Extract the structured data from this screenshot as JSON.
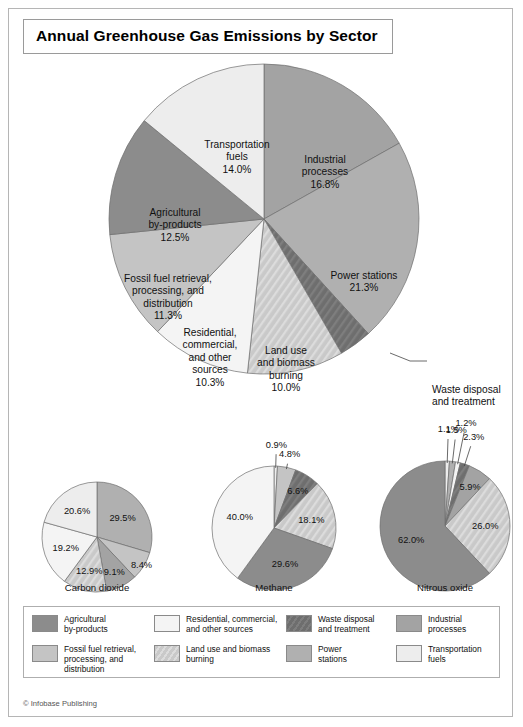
{
  "title": "Annual Greenhouse Gas Emissions by Sector",
  "credit": "© Infobase Publishing",
  "colors": {
    "agricultural": "#8c8c8c",
    "fossil_fuel": "#c4c4c4",
    "residential": "#f4f4f4",
    "land_use": "#c9c9c9",
    "waste": "#6e6e6e",
    "power": "#b0b0b0",
    "industrial": "#a3a3a3",
    "transportation": "#ededed",
    "outline": "#6e6e6e"
  },
  "chart_data": [
    {
      "type": "pie",
      "name": "main",
      "title": "Annual Greenhouse Gas Emissions by Sector",
      "start_angle": 0,
      "categories": [
        "Industrial processes",
        "Power stations",
        "Waste disposal and treatment",
        "Land use and biomass burning",
        "Residential, commercial, and other sources",
        "Fossil fuel retrieval, processing, and distribution",
        "Agricultural by-products",
        "Transportation fuels"
      ],
      "values": [
        16.8,
        21.3,
        3.4,
        10.0,
        10.3,
        11.3,
        12.5,
        14.0
      ],
      "keys": [
        "industrial",
        "power",
        "waste",
        "land_use",
        "residential",
        "fossil_fuel",
        "agricultural",
        "transportation"
      ],
      "labels": [
        {
          "lines": [
            "Industrial",
            "processes",
            "16.8%"
          ],
          "x": 316,
          "y": 108,
          "anchor": "middle",
          "callout": false
        },
        {
          "lines": [
            "Power stations",
            "21.3%"
          ],
          "x": 355,
          "y": 224,
          "anchor": "middle",
          "callout": false
        },
        {
          "lines": [
            "Waste disposal",
            "and treatment",
            "3.4%"
          ],
          "x": 423,
          "y": 338,
          "anchor": "start",
          "callout": true
        },
        {
          "lines": [
            "Land use",
            "and biomass",
            "burning",
            "10.0%"
          ],
          "x": 277,
          "y": 299,
          "anchor": "middle",
          "callout": false
        },
        {
          "lines": [
            "Residential,",
            "commercial,",
            "and other",
            "sources",
            "10.3%"
          ],
          "x": 201,
          "y": 281,
          "anchor": "middle",
          "callout": false
        },
        {
          "lines": [
            "Fossil fuel retrieval,",
            "processing, and",
            "distribution",
            "11.3%"
          ],
          "x": 159,
          "y": 227,
          "anchor": "middle",
          "callout": false
        },
        {
          "lines": [
            "Agricultural",
            "by-products",
            "12.5%"
          ],
          "x": 166,
          "y": 161,
          "anchor": "middle",
          "callout": false
        },
        {
          "lines": [
            "Transportation",
            "fuels",
            "14.0%"
          ],
          "x": 228,
          "y": 93,
          "anchor": "middle",
          "callout": false
        }
      ],
      "leader": {
        "x1": 381,
        "y1": 344,
        "x2": 401,
        "y2": 344,
        "x3": 418,
        "y3": 344
      }
    },
    {
      "type": "pie",
      "name": "carbon-dioxide",
      "title": "Carbon dioxide",
      "subtitle": "(72% of total)",
      "categories": [
        "Power stations",
        "Fossil fuel retrieval, processing, and distribution",
        "Industrial processes",
        "Land use and biomass burning",
        "Residential, commercial, and other sources",
        "Transportation fuels"
      ],
      "keys": [
        "power",
        "fossil_fuel",
        "industrial",
        "land_use",
        "residential",
        "transportation"
      ],
      "values": [
        29.5,
        8.4,
        9.1,
        12.9,
        19.2,
        20.6
      ],
      "labels": [
        "29.5%",
        "8.4%",
        "9.1%",
        "12.9%",
        "19.2%",
        "20.6%"
      ],
      "label_radius": [
        0.58,
        0.95,
        0.7,
        0.62,
        0.6,
        0.6
      ]
    },
    {
      "type": "pie",
      "name": "methane",
      "title": "Methane",
      "subtitle": "(18% of total)",
      "categories": [
        "Residential, commercial, and other sources",
        "Fossil fuel retrieval, processing, and distribution",
        "Waste disposal and treatment",
        "Land use and biomass burning",
        "Agricultural by-products",
        "Industrial processes"
      ],
      "keys": [
        "transportation",
        "fossil_fuel",
        "waste",
        "land_use",
        "agricultural",
        "residential"
      ],
      "values": [
        0.9,
        4.8,
        6.6,
        18.1,
        29.6,
        40.0
      ],
      "labels": [
        "0.9%",
        "4.8%",
        "6.6%",
        "18.1%",
        "29.6%",
        "40.0%"
      ],
      "label_radius": [
        1.35,
        1.22,
        0.72,
        0.62,
        0.6,
        0.58
      ]
    },
    {
      "type": "pie",
      "name": "nitrous-oxide",
      "title": "Nitrous oxide",
      "subtitle": "(9% of total)",
      "categories": [
        "Transportation fuels",
        "Power stations",
        "Residential, commercial, and other sources",
        "Waste disposal and treatment",
        "Industrial processes",
        "Land use and biomass burning",
        "Agricultural by-products"
      ],
      "keys": [
        "transportation",
        "power",
        "residential",
        "waste",
        "industrial",
        "land_use",
        "agricultural"
      ],
      "values": [
        1.1,
        1.5,
        1.2,
        2.3,
        5.9,
        26.0,
        62.0
      ],
      "labels": [
        "1.1%",
        "1.5%",
        "1.2%",
        "2.3%",
        "5.9%",
        "26.0%",
        "62.0%"
      ],
      "label_radius": [
        1.5,
        1.5,
        1.62,
        1.45,
        0.72,
        0.62,
        0.56
      ]
    }
  ],
  "sub_captions": [
    {
      "title": "Carbon dioxide",
      "subtitle": "(72% of total)",
      "x": 88
    },
    {
      "title": "Methane",
      "subtitle": "(18% of total)",
      "x": 265
    },
    {
      "title": "Nitrous oxide",
      "subtitle": "(9% of total)",
      "x": 436
    }
  ],
  "legend": [
    {
      "key": "agricultural",
      "lines": [
        "Agricultural",
        "by-products"
      ]
    },
    {
      "key": "residential",
      "lines": [
        "Residential, commercial,",
        "and other sources"
      ]
    },
    {
      "key": "waste",
      "lines": [
        "Waste disposal",
        "and treatment"
      ]
    },
    {
      "key": "industrial",
      "lines": [
        "Industrial",
        "processes"
      ]
    },
    {
      "key": "fossil_fuel",
      "lines": [
        "Fossil fuel retrieval,",
        "processing, and distribution"
      ]
    },
    {
      "key": "land_use",
      "lines": [
        "Land use and biomass",
        "burning"
      ]
    },
    {
      "key": "power",
      "lines": [
        "Power",
        "stations"
      ]
    },
    {
      "key": "transportation",
      "lines": [
        "Transportation",
        "fuels"
      ]
    }
  ]
}
